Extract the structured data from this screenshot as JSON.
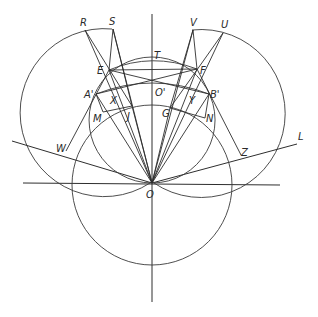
{
  "figure": {
    "type": "geometric-construction",
    "origin_label": "O",
    "labels": {
      "R": "R",
      "S": "S",
      "V": "V",
      "U": "U",
      "T": "T",
      "E": "E",
      "F": "F",
      "A_prime": "A'",
      "B_prime": "B'",
      "O_prime": "O'",
      "X": "X",
      "Y": "Y",
      "M": "M",
      "N": "N",
      "J": "J",
      "G": "G",
      "W": "W",
      "Z": "Z",
      "L": "L",
      "O": "O"
    }
  },
  "colors": {
    "line": "#2e2e2e",
    "background": "#ffffff"
  }
}
